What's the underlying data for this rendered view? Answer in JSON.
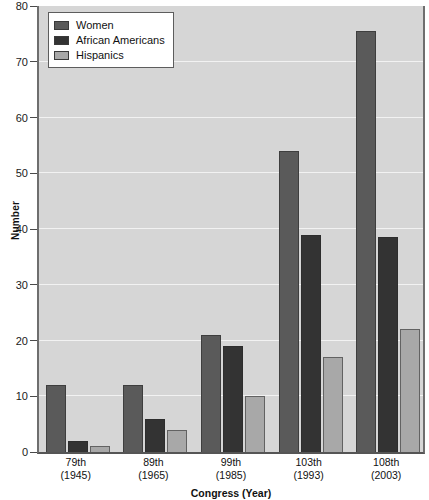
{
  "chart": {
    "type": "bar",
    "title": "",
    "xlabel": "Congress (Year)",
    "ylabel": "Number"
  },
  "axes": {
    "y_ticks": [
      "0",
      "10",
      "20",
      "30",
      "40",
      "50",
      "60",
      "70",
      "80"
    ],
    "x_categories": [
      {
        "line1": "79th",
        "line2": "(1945)"
      },
      {
        "line1": "89th",
        "line2": "(1965)"
      },
      {
        "line1": "99th",
        "line2": "(1985)"
      },
      {
        "line1": "103th",
        "line2": "(1993)"
      },
      {
        "line1": "108th",
        "line2": "(2003)"
      }
    ]
  },
  "legend": {
    "position": "top-left",
    "entries": [
      {
        "label": "Women",
        "color": "#5a5a5a"
      },
      {
        "label": "African Americans",
        "color": "#333333"
      },
      {
        "label": "Hispanics",
        "color": "#a8a8a8"
      }
    ]
  },
  "colors": {
    "plot_background": "#d6d6d6",
    "gridline": "#f2f2f2",
    "axis_line": "#5d5d5d",
    "women": "#5a5a5a",
    "african_americans": "#333333",
    "hispanics": "#a8a8a8"
  },
  "chart_data": {
    "type": "bar",
    "title": "",
    "xlabel": "Congress (Year)",
    "ylabel": "Number",
    "ylim": [
      0,
      80
    ],
    "ytick_step": 10,
    "grid": true,
    "legend_position": "top-left",
    "categories": [
      "79th (1945)",
      "89th (1965)",
      "99th (1985)",
      "103th (1993)",
      "108th (2003)"
    ],
    "series": [
      {
        "name": "Women",
        "color": "#5a5a5a",
        "values": [
          12,
          12,
          21,
          54,
          75.5
        ]
      },
      {
        "name": "African Americans",
        "color": "#333333",
        "values": [
          2,
          6,
          19,
          39,
          38.5
        ]
      },
      {
        "name": "Hispanics",
        "color": "#a8a8a8",
        "values": [
          1,
          4,
          10,
          17,
          22
        ]
      }
    ]
  }
}
